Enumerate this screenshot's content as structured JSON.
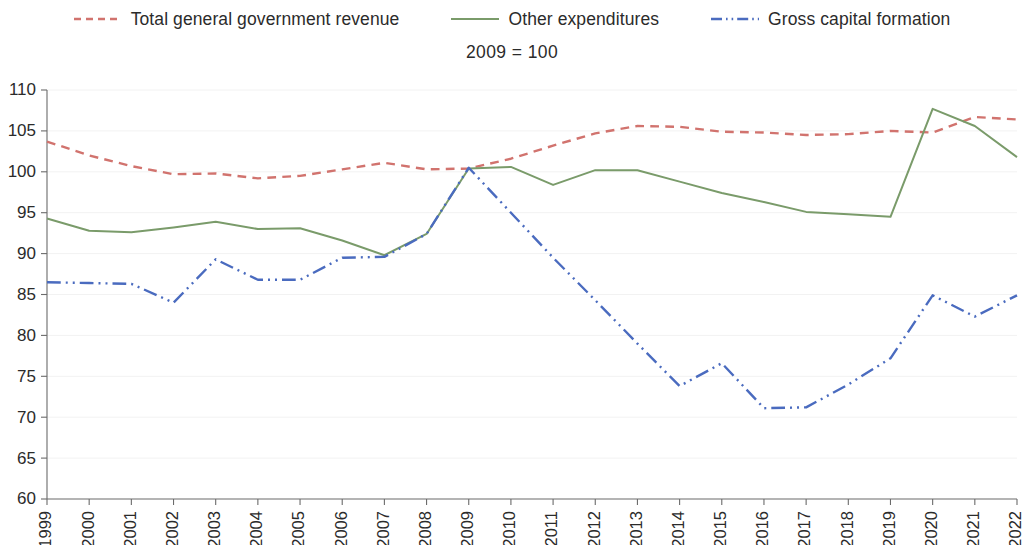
{
  "subtitle": "2009 = 100",
  "legend": {
    "position": "top",
    "items": [
      {
        "label": "Total general government revenue",
        "color": "#d1736e",
        "style": "dashed",
        "icon": "dashed-line-swatch"
      },
      {
        "label": "Other expenditures",
        "color": "#7a9b6a",
        "style": "solid",
        "icon": "solid-line-swatch"
      },
      {
        "label": "Gross capital formation",
        "color": "#4a6bbf",
        "style": "dash-dot-dot",
        "icon": "dash-dot-dot-line-swatch"
      }
    ]
  },
  "axes": {
    "y_ticks": [
      "60",
      "65",
      "70",
      "75",
      "80",
      "85",
      "90",
      "95",
      "100",
      "105",
      "110"
    ],
    "x_ticks": [
      "1999",
      "2000",
      "2001",
      "2002",
      "2003",
      "2004",
      "2005",
      "2006",
      "2007",
      "2008",
      "2009",
      "2010",
      "2011",
      "2012",
      "2013",
      "2014",
      "2015",
      "2016",
      "2017",
      "2018",
      "2019",
      "2020",
      "2021",
      "2022"
    ]
  },
  "chart_data": {
    "type": "line",
    "title": "",
    "subtitle": "2009 = 100",
    "xlabel": "",
    "ylabel": "",
    "ylim": [
      60,
      110
    ],
    "ytick_step": 5,
    "grid": true,
    "legend_position": "top",
    "x": [
      1999,
      2000,
      2001,
      2002,
      2003,
      2004,
      2005,
      2006,
      2007,
      2008,
      2009,
      2010,
      2011,
      2012,
      2013,
      2014,
      2015,
      2016,
      2017,
      2018,
      2019,
      2020,
      2021,
      2022
    ],
    "categories": [
      "1999",
      "2000",
      "2001",
      "2002",
      "2003",
      "2004",
      "2005",
      "2006",
      "2007",
      "2008",
      "2009",
      "2010",
      "2011",
      "2012",
      "2013",
      "2014",
      "2015",
      "2016",
      "2017",
      "2018",
      "2019",
      "2020",
      "2021",
      "2022"
    ],
    "series": [
      {
        "name": "Total general government revenue",
        "color": "#d1736e",
        "style": "dashed",
        "values": [
          103.7,
          102.0,
          100.7,
          99.7,
          99.8,
          99.2,
          99.5,
          100.3,
          101.1,
          100.3,
          100.4,
          101.6,
          103.2,
          104.7,
          105.6,
          105.5,
          104.9,
          104.8,
          104.5,
          104.6,
          105.0,
          104.8,
          106.7,
          106.4
        ]
      },
      {
        "name": "Other expenditures",
        "color": "#7a9b6a",
        "style": "solid",
        "values": [
          94.3,
          92.8,
          92.6,
          93.2,
          93.9,
          93.0,
          93.1,
          91.6,
          89.8,
          92.4,
          100.4,
          100.6,
          98.4,
          100.2,
          100.2,
          98.8,
          97.4,
          96.3,
          95.1,
          94.8,
          94.5,
          107.7,
          105.6,
          101.8
        ]
      },
      {
        "name": "Gross capital formation",
        "color": "#4a6bbf",
        "style": "dash-dot-dot",
        "values": [
          86.5,
          86.4,
          86.3,
          84.0,
          89.3,
          86.8,
          86.8,
          89.5,
          89.6,
          92.4,
          100.5,
          95.0,
          89.5,
          84.3,
          79.0,
          73.8,
          76.6,
          71.1,
          71.2,
          74.0,
          77.2,
          84.9,
          82.3,
          84.9
        ]
      }
    ]
  }
}
